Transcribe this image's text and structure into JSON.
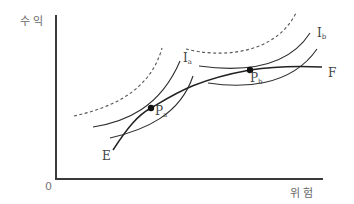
{
  "diagram": {
    "type": "risk-return indifference curves with efficient frontier",
    "y_axis_label": "수 익",
    "x_axis_label": "위 험",
    "origin_label": "0",
    "frontier": {
      "start_label": "E",
      "end_label": "F"
    },
    "points": [
      {
        "name": "P",
        "subscript": "a"
      },
      {
        "name": "P",
        "subscript": "b"
      }
    ],
    "indifference_curves": [
      {
        "name": "I",
        "subscript": "a"
      },
      {
        "name": "I",
        "subscript": "b"
      }
    ],
    "colors": {
      "line": "#2e2e2e",
      "axis": "#3a3a3a",
      "label": "#666666"
    }
  }
}
